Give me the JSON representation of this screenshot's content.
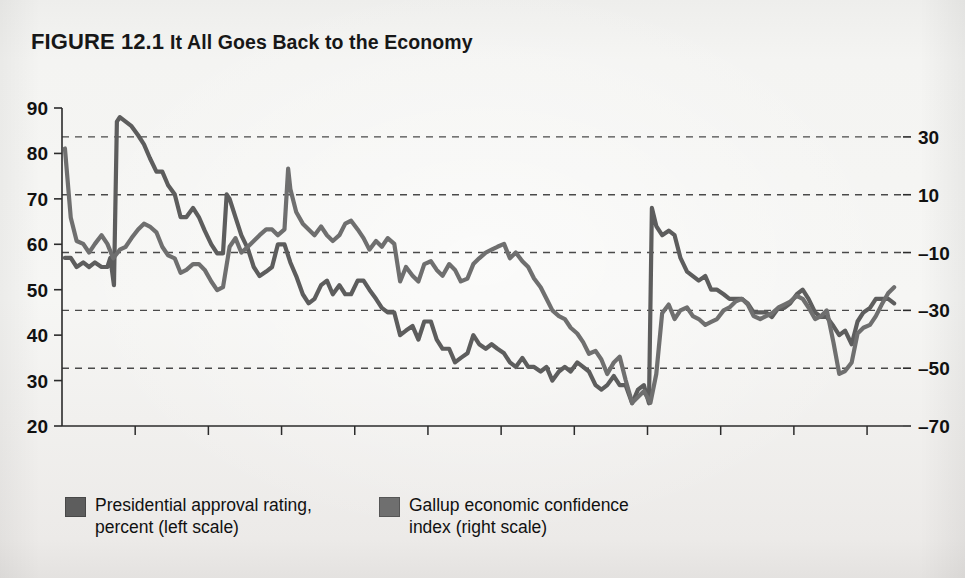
{
  "figure": {
    "number_label": "FIGURE 12.1",
    "title": "It All Goes Back to the Economy"
  },
  "legend": {
    "items": [
      {
        "key": "approval",
        "label_line1": "Presidential approval rating,",
        "label_line2": "percent (left scale)",
        "swatch_color": "#5d5d5d"
      },
      {
        "key": "confidence",
        "label_line1": "Gallup economic confidence",
        "label_line2": "index (right scale)",
        "swatch_color": "#6f6f6f"
      }
    ]
  },
  "chart_data": {
    "type": "line",
    "title": "It All Goes Back to the Economy",
    "xlabel": "",
    "ylabel": "",
    "grid": true,
    "legend_position": "bottom",
    "x_ticks": [
      "2001",
      "2002",
      "2003",
      "2004",
      "2005",
      "2006",
      "2007",
      "2008",
      "2009",
      "2010",
      "2011",
      "2012"
    ],
    "x_range": [
      2001.0,
      2012.45
    ],
    "axes": [
      {
        "id": "left",
        "name": "Presidential approval rating, percent (left scale)",
        "ticks": [
          20,
          30,
          40,
          50,
          60,
          70,
          80,
          90
        ],
        "range": [
          20,
          90
        ],
        "color": "#5d5d5d"
      },
      {
        "id": "right",
        "name": "Gallup economic confidence index (right scale)",
        "ticks": [
          -70,
          -50,
          -30,
          -10,
          10,
          30
        ],
        "range": [
          -70,
          40
        ],
        "color": "#6f6f6f",
        "gridline_values": [
          -50,
          -30,
          -10,
          10,
          30
        ]
      }
    ],
    "series": [
      {
        "name": "Presidential approval rating, percent (left scale)",
        "axis": "left",
        "color": "#5d5d5d",
        "x": [
          2001.04,
          2001.12,
          2001.2,
          2001.29,
          2001.37,
          2001.45,
          2001.54,
          2001.62,
          2001.66,
          2001.71,
          2001.75,
          2001.79,
          2001.87,
          2001.95,
          2002.04,
          2002.12,
          2002.2,
          2002.29,
          2002.37,
          2002.45,
          2002.54,
          2002.62,
          2002.7,
          2002.79,
          2002.87,
          2002.95,
          2003.04,
          2003.12,
          2003.2,
          2003.25,
          2003.29,
          2003.37,
          2003.45,
          2003.54,
          2003.62,
          2003.7,
          2003.79,
          2003.87,
          2003.95,
          2004.04,
          2004.12,
          2004.2,
          2004.29,
          2004.37,
          2004.45,
          2004.54,
          2004.62,
          2004.7,
          2004.79,
          2004.87,
          2004.95,
          2005.04,
          2005.12,
          2005.2,
          2005.29,
          2005.37,
          2005.45,
          2005.54,
          2005.62,
          2005.7,
          2005.79,
          2005.87,
          2005.95,
          2006.04,
          2006.12,
          2006.2,
          2006.29,
          2006.37,
          2006.45,
          2006.54,
          2006.62,
          2006.7,
          2006.79,
          2006.87,
          2006.95,
          2007.04,
          2007.12,
          2007.2,
          2007.29,
          2007.37,
          2007.45,
          2007.54,
          2007.62,
          2007.7,
          2007.79,
          2007.87,
          2007.95,
          2008.04,
          2008.12,
          2008.2,
          2008.29,
          2008.37,
          2008.45,
          2008.54,
          2008.62,
          2008.7,
          2008.79,
          2008.87,
          2008.95,
          2009.02,
          2009.06,
          2009.12,
          2009.2,
          2009.29,
          2009.37,
          2009.45,
          2009.54,
          2009.62,
          2009.7,
          2009.79,
          2009.87,
          2009.95,
          2010.04,
          2010.12,
          2010.2,
          2010.29,
          2010.37,
          2010.45,
          2010.54,
          2010.62,
          2010.7,
          2010.79,
          2010.87,
          2010.95,
          2011.04,
          2011.12,
          2011.2,
          2011.29,
          2011.37,
          2011.45,
          2011.54,
          2011.62,
          2011.7,
          2011.79,
          2011.87,
          2011.95,
          2012.04,
          2012.12,
          2012.2,
          2012.29,
          2012.37
        ],
        "y": [
          57,
          57,
          55,
          56,
          55,
          56,
          55,
          55,
          57,
          51,
          87,
          88,
          87,
          86,
          84,
          82,
          79,
          76,
          76,
          73,
          71,
          66,
          66,
          68,
          66,
          63,
          60,
          58,
          58,
          71,
          70,
          66,
          62,
          59,
          55,
          53,
          54,
          55,
          60,
          60,
          56,
          53,
          49,
          47,
          48,
          51,
          52,
          49,
          51,
          49,
          49,
          52,
          52,
          50,
          48,
          46,
          45,
          45,
          40,
          41,
          42,
          39,
          43,
          43,
          39,
          37,
          37,
          34,
          35,
          36,
          40,
          38,
          37,
          38,
          37,
          36,
          34,
          33,
          35,
          33,
          33,
          32,
          33,
          30,
          32,
          33,
          32,
          34,
          33,
          32,
          29,
          28,
          29,
          31,
          29,
          29,
          25,
          28,
          29,
          25,
          68,
          64,
          62,
          63,
          62,
          57,
          54,
          53,
          52,
          53,
          50,
          50,
          49,
          48,
          48,
          48,
          47,
          45,
          45,
          45,
          44,
          46,
          46,
          47,
          49,
          50,
          48,
          45,
          44,
          44,
          42,
          40,
          41,
          38,
          43,
          45,
          46,
          48,
          48,
          48,
          47
        ]
      },
      {
        "name": "Gallup economic confidence index (right scale)",
        "axis": "right",
        "color": "#6f6f6f",
        "x": [
          2001.04,
          2001.12,
          2001.2,
          2001.29,
          2001.37,
          2001.45,
          2001.54,
          2001.62,
          2001.7,
          2001.79,
          2001.87,
          2001.95,
          2002.04,
          2002.12,
          2002.2,
          2002.29,
          2002.37,
          2002.45,
          2002.54,
          2002.62,
          2002.7,
          2002.79,
          2002.87,
          2002.95,
          2003.04,
          2003.12,
          2003.2,
          2003.29,
          2003.37,
          2003.45,
          2003.54,
          2003.62,
          2003.7,
          2003.79,
          2003.87,
          2003.95,
          2004.04,
          2004.09,
          2004.12,
          2004.2,
          2004.29,
          2004.37,
          2004.45,
          2004.54,
          2004.62,
          2004.7,
          2004.79,
          2004.87,
          2004.95,
          2005.04,
          2005.12,
          2005.2,
          2005.29,
          2005.37,
          2005.45,
          2005.54,
          2005.62,
          2005.7,
          2005.79,
          2005.87,
          2005.95,
          2006.04,
          2006.12,
          2006.2,
          2006.29,
          2006.37,
          2006.45,
          2006.54,
          2006.62,
          2006.7,
          2006.79,
          2006.87,
          2006.95,
          2007.04,
          2007.12,
          2007.2,
          2007.29,
          2007.37,
          2007.45,
          2007.54,
          2007.62,
          2007.7,
          2007.79,
          2007.87,
          2007.95,
          2008.04,
          2008.12,
          2008.2,
          2008.29,
          2008.37,
          2008.45,
          2008.54,
          2008.62,
          2008.7,
          2008.79,
          2008.87,
          2008.95,
          2009.04,
          2009.12,
          2009.2,
          2009.29,
          2009.37,
          2009.45,
          2009.54,
          2009.62,
          2009.7,
          2009.79,
          2009.87,
          2009.95,
          2010.04,
          2010.12,
          2010.2,
          2010.29,
          2010.37,
          2010.45,
          2010.54,
          2010.62,
          2010.7,
          2010.79,
          2010.87,
          2010.95,
          2011.04,
          2011.12,
          2011.2,
          2011.29,
          2011.37,
          2011.45,
          2011.54,
          2011.62,
          2011.7,
          2011.79,
          2011.87,
          2011.95,
          2012.04,
          2012.12,
          2012.2,
          2012.29,
          2012.37
        ],
        "y": [
          26,
          2,
          -6,
          -7,
          -10,
          -7,
          -4,
          -7,
          -12,
          -9,
          -8,
          -5,
          -2,
          0,
          -1,
          -3,
          -8,
          -11,
          -12,
          -17,
          -16,
          -14,
          -14,
          -16,
          -20,
          -23,
          -22,
          -8,
          -5,
          -10,
          -8,
          -6,
          -4,
          -2,
          -2,
          -4,
          -2,
          19,
          12,
          4,
          0,
          -2,
          -4,
          -1,
          -4,
          -6,
          -4,
          0,
          1,
          -2,
          -5,
          -9,
          -6,
          -8,
          -5,
          -7,
          -20,
          -15,
          -18,
          -20,
          -14,
          -13,
          -16,
          -18,
          -14,
          -16,
          -20,
          -19,
          -14,
          -12,
          -10,
          -9,
          -8,
          -7,
          -12,
          -10,
          -13,
          -15,
          -19,
          -22,
          -26,
          -30,
          -32,
          -33,
          -36,
          -38,
          -41,
          -45,
          -44,
          -47,
          -52,
          -48,
          -46,
          -54,
          -62,
          -60,
          -58,
          -62,
          -52,
          -31,
          -28,
          -33,
          -30,
          -29,
          -32,
          -33,
          -35,
          -34,
          -33,
          -30,
          -29,
          -27,
          -26,
          -28,
          -32,
          -33,
          -32,
          -31,
          -29,
          -28,
          -27,
          -25,
          -26,
          -29,
          -33,
          -32,
          -30,
          -41,
          -52,
          -51,
          -48,
          -38,
          -36,
          -35,
          -32,
          -28,
          -24,
          -22
        ]
      }
    ]
  }
}
